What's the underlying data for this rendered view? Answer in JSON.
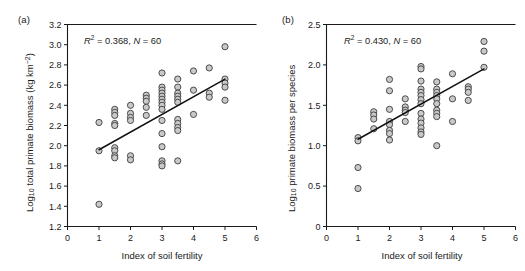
{
  "figure": {
    "background": "#ffffff",
    "marker_fill": "#c9c9c9",
    "marker_stroke": "#3c3c3c",
    "line_color": "#111111",
    "axis_color": "#1a1a1a"
  },
  "panels": {
    "a": {
      "tag": "(a)",
      "annotation": {
        "r2_symbol": "R",
        "r2_exponent": "2",
        "r2_value": "= 0.368,",
        "n_symbol": "N",
        "n_value": "= 60",
        "full_text": "R2 = 0.368, N = 60"
      },
      "xlabel": "Index of soil fertility",
      "ylabel_main": "Log",
      "ylabel_sub": "10",
      "ylabel_rest": " total primate biomass (kg km",
      "ylabel_sup": "−2",
      "ylabel_close": ")",
      "ylabel_full": "Log10 total primate biomass (kg km-2)",
      "xticks": [
        "0",
        "1",
        "2",
        "3",
        "4",
        "5",
        "6"
      ],
      "yticks": [
        "1.2",
        "1.4",
        "1.6",
        "1.8",
        "2.0",
        "2.2",
        "2.4",
        "2.6",
        "2.8",
        "3.0",
        "3.2"
      ]
    },
    "b": {
      "tag": "(b)",
      "annotation": {
        "r2_symbol": "R",
        "r2_exponent": "2",
        "r2_value": "= 0.430,",
        "n_symbol": "N",
        "n_value": "= 60",
        "full_text": "R2 = 0.430, N = 60"
      },
      "xlabel": "Index of soil fertility",
      "ylabel_main": "Log",
      "ylabel_sub": "10",
      "ylabel_rest": " primate biomass per species",
      "ylabel_full": "Log10 primate biomass per species",
      "xticks": [
        "0",
        "1",
        "2",
        "3",
        "4",
        "5",
        "6"
      ],
      "yticks": [
        "0",
        "0.5",
        "1.0",
        "1.5",
        "2.0",
        "2.5"
      ]
    }
  },
  "chart_data": [
    {
      "type": "scatter",
      "panel": "a",
      "title": "(a)",
      "xlabel": "Index of soil fertility",
      "ylabel": "Log10 total primate biomass (kg km-2)",
      "xlim": [
        0,
        6
      ],
      "ylim": [
        1.2,
        3.2
      ],
      "xticks": [
        0,
        1,
        2,
        3,
        4,
        5,
        6
      ],
      "yticks": [
        1.2,
        1.4,
        1.6,
        1.8,
        2.0,
        2.2,
        2.4,
        2.6,
        2.8,
        3.0,
        3.2
      ],
      "grid": false,
      "legend": null,
      "annotations": [
        "R2 = 0.368, N = 60"
      ],
      "r_squared": 0.368,
      "n": 60,
      "points": [
        [
          1.0,
          2.23
        ],
        [
          1.0,
          1.95
        ],
        [
          1.0,
          1.42
        ],
        [
          1.5,
          2.36
        ],
        [
          1.5,
          2.33
        ],
        [
          1.5,
          2.3
        ],
        [
          1.5,
          2.22
        ],
        [
          1.5,
          2.2
        ],
        [
          1.5,
          1.98
        ],
        [
          1.5,
          1.95
        ],
        [
          1.5,
          1.9
        ],
        [
          1.5,
          1.88
        ],
        [
          2.0,
          2.4
        ],
        [
          2.0,
          2.32
        ],
        [
          2.0,
          2.28
        ],
        [
          2.0,
          2.25
        ],
        [
          2.0,
          1.9
        ],
        [
          2.0,
          1.86
        ],
        [
          2.5,
          2.5
        ],
        [
          2.5,
          2.47
        ],
        [
          2.5,
          2.44
        ],
        [
          2.5,
          2.38
        ],
        [
          2.5,
          2.3
        ],
        [
          3.0,
          2.72
        ],
        [
          3.0,
          2.58
        ],
        [
          3.0,
          2.55
        ],
        [
          3.0,
          2.52
        ],
        [
          3.0,
          2.49
        ],
        [
          3.0,
          2.46
        ],
        [
          3.0,
          2.43
        ],
        [
          3.0,
          2.4
        ],
        [
          3.0,
          2.36
        ],
        [
          3.0,
          2.25
        ],
        [
          3.0,
          2.12
        ],
        [
          3.0,
          1.99
        ],
        [
          3.0,
          1.85
        ],
        [
          3.0,
          1.82
        ],
        [
          3.0,
          1.8
        ],
        [
          3.5,
          2.66
        ],
        [
          3.5,
          2.58
        ],
        [
          3.5,
          2.52
        ],
        [
          3.5,
          2.49
        ],
        [
          3.5,
          2.46
        ],
        [
          3.5,
          2.43
        ],
        [
          3.5,
          2.26
        ],
        [
          3.5,
          2.22
        ],
        [
          3.5,
          2.18
        ],
        [
          3.5,
          2.15
        ],
        [
          3.5,
          1.85
        ],
        [
          4.0,
          2.74
        ],
        [
          4.0,
          2.55
        ],
        [
          4.0,
          2.31
        ],
        [
          4.5,
          2.77
        ],
        [
          4.5,
          2.52
        ],
        [
          4.5,
          2.48
        ],
        [
          5.0,
          2.98
        ],
        [
          5.0,
          2.66
        ],
        [
          5.0,
          2.62
        ],
        [
          5.0,
          2.58
        ],
        [
          5.0,
          2.45
        ]
      ],
      "fit_line": {
        "x": [
          1.0,
          5.0
        ],
        "y": [
          1.96,
          2.66
        ]
      }
    },
    {
      "type": "scatter",
      "panel": "b",
      "title": "(b)",
      "xlabel": "Index of soil fertility",
      "ylabel": "Log10 primate biomass per species",
      "xlim": [
        0,
        6
      ],
      "ylim": [
        0,
        2.5
      ],
      "xticks": [
        0,
        1,
        2,
        3,
        4,
        5,
        6
      ],
      "yticks": [
        0,
        0.5,
        1.0,
        1.5,
        2.0,
        2.5
      ],
      "grid": false,
      "legend": null,
      "annotations": [
        "R2 = 0.430, N = 60"
      ],
      "r_squared": 0.43,
      "n": 60,
      "points": [
        [
          1.0,
          1.1
        ],
        [
          1.0,
          1.06
        ],
        [
          1.0,
          0.73
        ],
        [
          1.0,
          0.47
        ],
        [
          1.5,
          1.42
        ],
        [
          1.5,
          1.38
        ],
        [
          1.5,
          1.33
        ],
        [
          1.5,
          1.21
        ],
        [
          2.0,
          1.82
        ],
        [
          2.0,
          1.68
        ],
        [
          2.0,
          1.45
        ],
        [
          2.0,
          1.3
        ],
        [
          2.0,
          1.26
        ],
        [
          2.0,
          1.19
        ],
        [
          2.0,
          1.15
        ],
        [
          2.0,
          1.07
        ],
        [
          2.5,
          1.58
        ],
        [
          2.5,
          1.48
        ],
        [
          2.5,
          1.44
        ],
        [
          2.5,
          1.41
        ],
        [
          2.5,
          1.3
        ],
        [
          3.0,
          1.98
        ],
        [
          3.0,
          1.95
        ],
        [
          3.0,
          1.8
        ],
        [
          3.0,
          1.7
        ],
        [
          3.0,
          1.66
        ],
        [
          3.0,
          1.62
        ],
        [
          3.0,
          1.57
        ],
        [
          3.0,
          1.52
        ],
        [
          3.0,
          1.4
        ],
        [
          3.0,
          1.33
        ],
        [
          3.0,
          1.28
        ],
        [
          3.0,
          1.22
        ],
        [
          3.0,
          1.17
        ],
        [
          3.0,
          1.14
        ],
        [
          3.5,
          1.79
        ],
        [
          3.5,
          1.7
        ],
        [
          3.5,
          1.66
        ],
        [
          3.5,
          1.62
        ],
        [
          3.5,
          1.58
        ],
        [
          3.5,
          1.52
        ],
        [
          3.5,
          1.44
        ],
        [
          3.5,
          1.4
        ],
        [
          3.5,
          1.36
        ],
        [
          3.5,
          1.0
        ],
        [
          4.0,
          1.89
        ],
        [
          4.0,
          1.58
        ],
        [
          4.0,
          1.3
        ],
        [
          4.5,
          1.73
        ],
        [
          4.5,
          1.7
        ],
        [
          4.5,
          1.66
        ],
        [
          4.5,
          1.56
        ],
        [
          5.0,
          2.29
        ],
        [
          5.0,
          2.17
        ],
        [
          5.0,
          1.97
        ]
      ],
      "fit_line": {
        "x": [
          1.0,
          5.0
        ],
        "y": [
          1.08,
          1.95
        ]
      }
    }
  ]
}
